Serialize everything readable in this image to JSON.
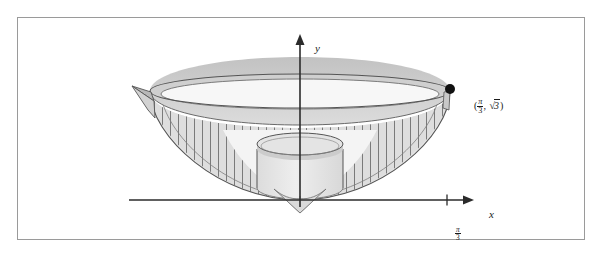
{
  "figure": {
    "kind": "calculus-solid-of-revolution-diagram",
    "background_color": "#ffffff",
    "frame_border_color": "#9a9a9a",
    "axes": {
      "x_label": "x",
      "y_label": "y",
      "axis_color": "#2b2b2b",
      "origin_px": [
        299,
        199
      ],
      "x_axis_start_px": [
        128,
        199
      ],
      "x_axis_end_px": [
        466,
        199
      ],
      "y_axis_top_px": [
        299,
        33
      ],
      "y_axis_bottom_px": [
        299,
        205
      ]
    },
    "ticks": [
      {
        "name": "x-tick-pi-over-3",
        "axis": "x",
        "position_px": 446,
        "label_numerator": "π",
        "label_denominator": "3",
        "label_text": "π/3"
      }
    ],
    "annotations": [
      {
        "name": "rim-point-label",
        "marker": "filled-dot",
        "marker_color": "#111111",
        "marker_px": [
          448,
          88
        ],
        "label_open": "(",
        "label_x_numerator": "π",
        "label_x_denominator": "3",
        "label_separator": ", ",
        "label_radical": "√",
        "label_radicand": "3",
        "label_close": ")",
        "label_text": "(π/3, √3)"
      }
    ],
    "solid": {
      "name": "bowl-of-revolution",
      "description": "Solid generated by revolving a curve about the y-axis, drawn as a bowl with a thick rim band, vertical hatching on the lower wall, and an inscribed cylindrical shell.",
      "rim_band_fill": "#d0d0d0",
      "rim_band_top_fill": "#c4c4c4",
      "bowl_interior_fill": "#f2f2f2",
      "wall_fill": "#dcdcdc",
      "hatch_color": "#6e6e6e",
      "outline_color": "#555555",
      "rim_center_px": [
        299,
        90
      ],
      "rim_radius_x_px": 150,
      "rim_radius_y_px": 17,
      "rim_band_thickness_px": 20,
      "bowl_bottom_px": [
        299,
        199
      ]
    },
    "cylinder": {
      "name": "inscribed-cylindrical-shell",
      "center_px": [
        299,
        148
      ],
      "radius_x_px": 43,
      "radius_y_px": 11,
      "height_px": 47,
      "top_fill": "#e0e0e0",
      "body_fill": "#e8e8e8",
      "outline_color": "#555555"
    },
    "wedge": {
      "name": "left-rim-wedge-flap",
      "fill": "#bdbdbd",
      "outline_color": "#555555",
      "apex_px": [
        150,
        90
      ]
    }
  }
}
